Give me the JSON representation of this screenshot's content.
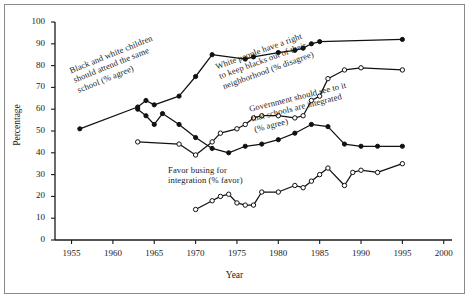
{
  "figure": {
    "axis_x_label": "Year",
    "axis_y_label": "Percentage"
  },
  "chart_data": {
    "type": "line",
    "title": "",
    "xlabel": "Year",
    "ylabel": "Percentage",
    "xlim": [
      1953,
      2001
    ],
    "ylim": [
      0,
      100
    ],
    "xticks": [
      1955,
      1960,
      1965,
      1970,
      1975,
      1980,
      1985,
      1990,
      1995,
      2000
    ],
    "yticks": [
      0,
      10,
      20,
      30,
      40,
      50,
      60,
      70,
      80,
      90,
      100
    ],
    "grid": false,
    "legend": "inline-annotations",
    "series": [
      {
        "name": "Black and white children should attend the same school (% agree)",
        "marker": "filled-circle",
        "points": [
          [
            1956,
            51
          ],
          [
            1963,
            61
          ],
          [
            1964,
            64
          ],
          [
            1965,
            62
          ],
          [
            1968,
            66
          ],
          [
            1970,
            75
          ],
          [
            1972,
            85
          ],
          [
            1976,
            83
          ],
          [
            1977,
            84
          ],
          [
            1980,
            86
          ],
          [
            1982,
            87
          ],
          [
            1983,
            88
          ],
          [
            1984,
            90
          ],
          [
            1985,
            91
          ],
          [
            1995,
            92
          ]
        ]
      },
      {
        "name": "White people have a right to keep blacks out of their neighborhood (% disagree)",
        "marker": "open-circle",
        "points": [
          [
            1963,
            45
          ],
          [
            1968,
            44
          ],
          [
            1970,
            39
          ],
          [
            1972,
            45
          ],
          [
            1973,
            49
          ],
          [
            1975,
            51
          ],
          [
            1976,
            53
          ],
          [
            1977,
            56
          ],
          [
            1978,
            57
          ],
          [
            1980,
            57
          ],
          [
            1982,
            56
          ],
          [
            1983,
            57
          ],
          [
            1984,
            64
          ],
          [
            1985,
            66
          ],
          [
            1986,
            74
          ],
          [
            1988,
            78
          ],
          [
            1990,
            79
          ],
          [
            1995,
            78
          ]
        ]
      },
      {
        "name": "Government should see to it that schools are integrated (% agree)",
        "marker": "filled-circle",
        "points": [
          [
            1963,
            60
          ],
          [
            1964,
            57
          ],
          [
            1965,
            53
          ],
          [
            1966,
            58
          ],
          [
            1968,
            53
          ],
          [
            1970,
            47
          ],
          [
            1972,
            42
          ],
          [
            1974,
            40
          ],
          [
            1976,
            43
          ],
          [
            1978,
            44
          ],
          [
            1980,
            46
          ],
          [
            1982,
            49
          ],
          [
            1984,
            53
          ],
          [
            1986,
            52
          ],
          [
            1988,
            44
          ],
          [
            1990,
            43
          ],
          [
            1992,
            43
          ],
          [
            1995,
            43
          ]
        ]
      },
      {
        "name": "Favor busing for integration (% favor)",
        "marker": "open-circle",
        "points": [
          [
            1970,
            14
          ],
          [
            1972,
            18
          ],
          [
            1973,
            20
          ],
          [
            1974,
            21
          ],
          [
            1975,
            17
          ],
          [
            1976,
            16
          ],
          [
            1977,
            16
          ],
          [
            1978,
            22
          ],
          [
            1980,
            22
          ],
          [
            1982,
            25
          ],
          [
            1983,
            24
          ],
          [
            1984,
            27
          ],
          [
            1985,
            30
          ],
          [
            1986,
            33
          ],
          [
            1988,
            25
          ],
          [
            1989,
            31
          ],
          [
            1990,
            32
          ],
          [
            1992,
            31
          ],
          [
            1995,
            35
          ]
        ]
      }
    ],
    "annotations": [
      {
        "id": "annotation-school-attendance",
        "lines": [
          "Black and white children",
          "should attend the same",
          "school (% agree)"
        ],
        "rotation": -22
      },
      {
        "id": "annotation-neighborhood-rights",
        "lines": [
          "White people have a right",
          "to keep blacks out of their",
          "neighborhood (% disagree)"
        ],
        "rotation": -20
      },
      {
        "id": "annotation-government-schools",
        "lines": [
          "Government should see to it",
          "that schools are integrated",
          "(% agree)"
        ],
        "rotation": -14
      },
      {
        "id": "annotation-busing",
        "lines": [
          "Favor busing for",
          "integration (% favor)"
        ],
        "rotation": 0
      }
    ]
  }
}
